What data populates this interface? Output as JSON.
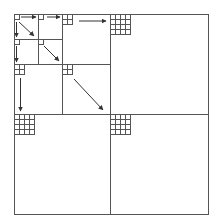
{
  "diagram": {
    "type": "recursive-quadtree-doubling",
    "stroke_color": "#444444",
    "background": "#ffffff",
    "outer": {
      "x0": 14,
      "y0": 14,
      "x1": 208,
      "y1": 214
    },
    "levels": [
      {
        "name": "level-1",
        "cells_per_side": 1,
        "origins": [
          [
            14,
            14
          ],
          [
            26,
            14
          ],
          [
            14,
            26
          ],
          [
            26,
            26
          ]
        ]
      },
      {
        "name": "level-2",
        "cells_per_side": 2,
        "origins": [
          [
            38,
            14
          ],
          [
            14,
            39
          ],
          [
            38,
            39
          ]
        ]
      },
      {
        "name": "level-3",
        "cells_per_side": 4,
        "origins": [
          [
            62,
            14
          ],
          [
            14,
            64
          ],
          [
            62,
            64
          ]
        ]
      },
      {
        "name": "level-4",
        "cells_per_side": 4,
        "origins": [
          [
            110,
            14
          ],
          [
            14,
            114
          ],
          [
            110,
            114
          ]
        ]
      }
    ],
    "arrows": [
      {
        "from": [
          20,
          17
        ],
        "to": [
          35,
          17
        ]
      },
      {
        "from": [
          18,
          22
        ],
        "to": [
          34,
          36
        ]
      },
      {
        "from": [
          17,
          22
        ],
        "to": [
          17,
          36
        ]
      },
      {
        "from": [
          46,
          17
        ],
        "to": [
          59,
          17
        ]
      },
      {
        "from": [
          16,
          45
        ],
        "to": [
          16,
          62
        ]
      },
      {
        "from": [
          43,
          46
        ],
        "to": [
          58,
          61
        ]
      },
      {
        "from": [
          79,
          21
        ],
        "to": [
          106,
          21
        ]
      },
      {
        "from": [
          20,
          77
        ],
        "to": [
          20,
          110
        ]
      },
      {
        "from": [
          74,
          79
        ],
        "to": [
          104,
          110
        ]
      }
    ]
  }
}
